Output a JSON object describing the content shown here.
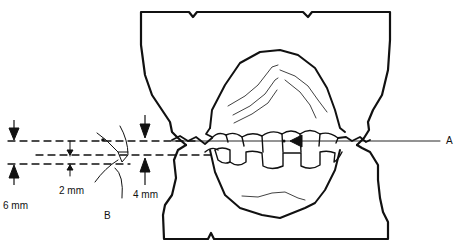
{
  "diagram": {
    "type": "dental occlusion measurement illustration",
    "labels": {
      "six_mm": "6 mm",
      "two_mm": "2 mm",
      "four_mm": "4 mm",
      "a": "A",
      "b": "B"
    },
    "colors": {
      "stroke": "#111111",
      "background": "#ffffff"
    }
  }
}
